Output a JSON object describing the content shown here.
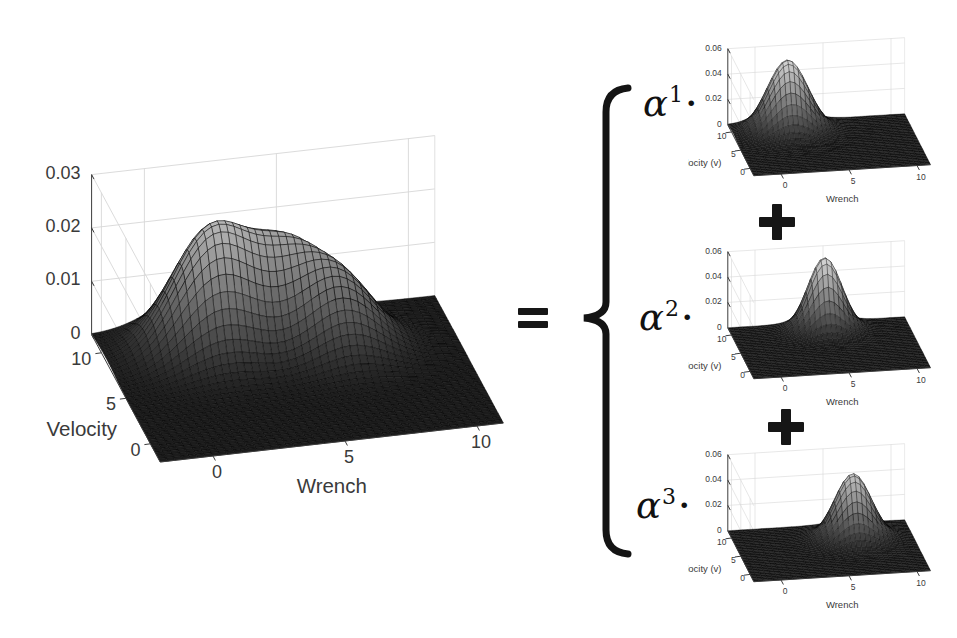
{
  "figure": {
    "description_visible_text_only": "",
    "operators": {
      "equals": "=",
      "plus": "+",
      "brace": "{"
    },
    "terms": [
      {
        "base": "α",
        "exp": "1",
        "dot": "·"
      },
      {
        "base": "α",
        "exp": "2",
        "dot": "·"
      },
      {
        "base": "α",
        "exp": "3",
        "dot": "·"
      }
    ]
  },
  "chart_data": [
    {
      "id": "mixture",
      "type": "surface",
      "title": "",
      "xlabel": "Wrench",
      "ylabel": "Velocity",
      "xlim": [
        -2,
        11
      ],
      "ylim": [
        -2,
        12
      ],
      "zlim": [
        0,
        0.03
      ],
      "xticks": [
        0,
        5,
        10
      ],
      "yticks": [
        0,
        5,
        10
      ],
      "zticks": [
        0,
        0.01,
        0.02,
        0.03
      ],
      "grid": true,
      "colormap": "gray",
      "peaks": [
        {
          "x": 2.0,
          "y": 9.0,
          "sx": 1.5,
          "sy": 1.9,
          "amp": 0.0225
        },
        {
          "x": 4.8,
          "y": 9.5,
          "sx": 1.25,
          "sy": 1.6,
          "amp": 0.013
        },
        {
          "x": 6.6,
          "y": 7.5,
          "sx": 1.35,
          "sy": 1.8,
          "amp": 0.013
        }
      ]
    },
    {
      "id": "component-1",
      "type": "surface",
      "coefficient": "α1",
      "title": "",
      "xlabel": "Wrench",
      "ylabel": "Velocity (v)",
      "xlim": [
        -2,
        11
      ],
      "ylim": [
        -2,
        12
      ],
      "zlim": [
        0,
        0.06
      ],
      "xticks": [
        0,
        5,
        10
      ],
      "yticks": [
        0,
        5,
        10
      ],
      "zticks": [
        0,
        0.02,
        0.04,
        0.06
      ],
      "grid": true,
      "colormap": "gray",
      "peaks": [
        {
          "x": 2.0,
          "y": 9.0,
          "sx": 1.5,
          "sy": 1.9,
          "amp": 0.057
        }
      ]
    },
    {
      "id": "component-2",
      "type": "surface",
      "coefficient": "α2",
      "title": "",
      "xlabel": "Wrench",
      "ylabel": "Velocity (v)",
      "xlim": [
        -2,
        11
      ],
      "ylim": [
        -2,
        12
      ],
      "zlim": [
        0,
        0.06
      ],
      "xticks": [
        0,
        5,
        10
      ],
      "yticks": [
        0,
        5,
        10
      ],
      "zticks": [
        0,
        0.02,
        0.04,
        0.06
      ],
      "grid": true,
      "colormap": "gray",
      "peaks": [
        {
          "x": 4.8,
          "y": 9.5,
          "sx": 1.25,
          "sy": 1.6,
          "amp": 0.058
        }
      ]
    },
    {
      "id": "component-3",
      "type": "surface",
      "coefficient": "α3",
      "title": "",
      "xlabel": "Wrench",
      "ylabel": "Velocity (v)",
      "xlim": [
        -2,
        11
      ],
      "ylim": [
        -2,
        12
      ],
      "zlim": [
        0,
        0.06
      ],
      "xticks": [
        0,
        5,
        10
      ],
      "yticks": [
        0,
        5,
        10
      ],
      "zticks": [
        0,
        0.02,
        0.04,
        0.06
      ],
      "grid": true,
      "colormap": "gray",
      "peaks": [
        {
          "x": 6.6,
          "y": 7.5,
          "sx": 1.35,
          "sy": 1.8,
          "amp": 0.052
        }
      ]
    }
  ]
}
